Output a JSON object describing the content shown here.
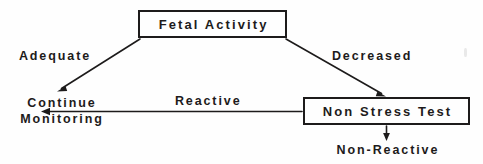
{
  "diagram": {
    "type": "flowchart",
    "background_color": "#fefefe",
    "line_color": "#1d1b1b",
    "text_color": "#1d1b1b",
    "nodes": [
      {
        "id": "fetal-activity",
        "label": "Fetal Activity",
        "shape": "rectangle",
        "boxed": true
      },
      {
        "id": "non-stress-test",
        "label": "Non Stress Test",
        "shape": "rectangle",
        "boxed": true
      },
      {
        "id": "continue-monitoring",
        "label": "Continue Monitoring",
        "label_line1": "Continue",
        "label_line2": "Monitoring",
        "shape": "text",
        "boxed": false
      },
      {
        "id": "non-reactive",
        "label": "Non-Reactive",
        "shape": "text",
        "boxed": false
      }
    ],
    "edges": [
      {
        "id": "edge-adequate",
        "from": "fetal-activity",
        "to": "continue-monitoring",
        "label": "Adequate",
        "direction": "diagonal-down-left",
        "arrowhead": true
      },
      {
        "id": "edge-decreased",
        "from": "fetal-activity",
        "to": "non-stress-test",
        "label": "Decreased",
        "direction": "diagonal-down-right",
        "arrowhead": true
      },
      {
        "id": "edge-reactive",
        "from": "non-stress-test",
        "to": "continue-monitoring",
        "label": "Reactive",
        "direction": "horizontal-left",
        "arrowhead": true
      },
      {
        "id": "edge-non-reactive",
        "from": "non-stress-test",
        "to": "non-reactive",
        "label": "",
        "direction": "vertical-down",
        "arrowhead": true
      }
    ]
  }
}
